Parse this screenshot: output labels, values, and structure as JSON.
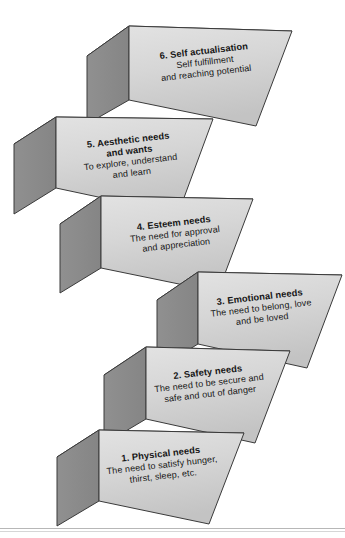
{
  "figure": {
    "name": "maslow-hierarchy-of-needs-steps",
    "type": "diagram",
    "background_color": "#ffffff",
    "block_front_color": "#d4d4d4",
    "block_top_color": "#9a9a9a",
    "block_side_color": "#8b8b8b",
    "edge_color": "#3a3a3a",
    "text_color": "#151515"
  },
  "blocks": [
    {
      "id": "block-6",
      "number": "6.",
      "title": "6. Self actualisation",
      "desc_line1": "Self fulfillment",
      "desc_line2": "and reaching potential",
      "desc_line3": ""
    },
    {
      "id": "block-5",
      "number": "5.",
      "title": "5. Aesthetic needs",
      "title2": "and wants",
      "desc_line1": "To explore, understand",
      "desc_line2": "and learn",
      "desc_line3": ""
    },
    {
      "id": "block-4",
      "number": "4.",
      "title": "4. Esteem needs",
      "desc_line1": "The need for approval",
      "desc_line2": "and appreciation",
      "desc_line3": ""
    },
    {
      "id": "block-3",
      "number": "3.",
      "title": "3. Emotional needs",
      "desc_line1": "The need to belong, love",
      "desc_line2": "and be loved",
      "desc_line3": ""
    },
    {
      "id": "block-2",
      "number": "2.",
      "title": "2. Safety needs",
      "desc_line1": "The need to be secure and",
      "desc_line2": "safe and out of danger",
      "desc_line3": ""
    },
    {
      "id": "block-1",
      "number": "1.",
      "title": "1. Physical needs",
      "desc_line1": "The need to satisfy hunger,",
      "desc_line2": "thirst, sleep, etc.",
      "desc_line3": ""
    }
  ]
}
